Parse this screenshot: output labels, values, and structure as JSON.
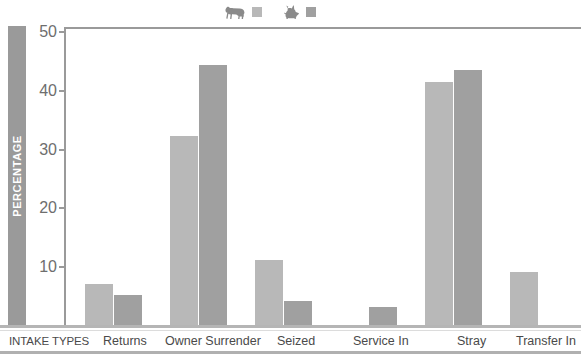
{
  "legend": {
    "entries": [
      {
        "icon": "dog-icon",
        "label": "",
        "color": "#b8b8b8"
      },
      {
        "icon": "cat-icon",
        "label": "",
        "color": "#a0a0a0"
      }
    ]
  },
  "axis": {
    "y_title": "PERCENTAGE",
    "x_axis_name": "INTAKE TYPES"
  },
  "colors": {
    "dog_bar": "#b8b8b8",
    "cat_bar": "#a0a0a0",
    "axis_line": "#9a9a9a",
    "baseline": "#b5b5b5",
    "y_title_bg": "#9a9a9a",
    "y_title_text": "#ffffff",
    "tick_label": "#6e6e6e",
    "x_label": "#4a4a4a"
  },
  "chart_data": {
    "type": "bar",
    "title": "",
    "subtitle": "",
    "xlabel": "INTAKE TYPES",
    "ylabel": "PERCENTAGE",
    "ylim": [
      0,
      50
    ],
    "yticks": [
      10,
      20,
      30,
      40,
      50
    ],
    "ytick_labels": [
      "10",
      "20",
      "30",
      "40",
      "50"
    ],
    "grid": false,
    "legend_position": "top-center",
    "categories": [
      "Returns",
      "Owner Surrender",
      "Seized",
      "Service In",
      "Stray",
      "Transfer In"
    ],
    "series": [
      {
        "name": "dog",
        "color": "#b8b8b8",
        "values": [
          7,
          32,
          11,
          0,
          41,
          9
        ]
      },
      {
        "name": "cat",
        "color": "#a0a0a0",
        "values": [
          5,
          44,
          4,
          3,
          43,
          0
        ]
      }
    ]
  }
}
